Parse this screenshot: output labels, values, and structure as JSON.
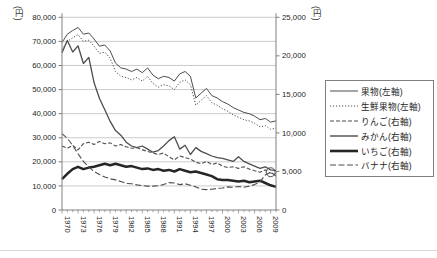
{
  "chart_data": {
    "type": "line",
    "title": "",
    "left_axis": {
      "unit_label": "(円)",
      "min": 0,
      "max": 80000,
      "tick_step": 10000,
      "tick_labels": [
        "0",
        "10,000",
        "20,000",
        "30,000",
        "40,000",
        "50,000",
        "60,000",
        "70,000",
        "80,000"
      ]
    },
    "right_axis": {
      "unit_label": "(円)",
      "min": 0,
      "max": 25000,
      "tick_step": 5000,
      "tick_labels": [
        "0",
        "5,000",
        "10,000",
        "15,000",
        "20,000",
        "25,000"
      ]
    },
    "x_axis": {
      "start_year": 1970,
      "end_year": 2010,
      "label_step": 3,
      "tick_labels": [
        "1970",
        "1973",
        "1976",
        "1979",
        "1982",
        "1985",
        "1988",
        "1991",
        "1994",
        "1997",
        "2000",
        "2003",
        "2006",
        "2009"
      ]
    },
    "grid": "horizontal",
    "legend_position": "right",
    "years": [
      1970,
      1971,
      1972,
      1973,
      1974,
      1975,
      1976,
      1977,
      1978,
      1979,
      1980,
      1981,
      1982,
      1983,
      1984,
      1985,
      1986,
      1987,
      1988,
      1989,
      1990,
      1991,
      1992,
      1993,
      1994,
      1995,
      1996,
      1997,
      1998,
      1999,
      2000,
      2001,
      2002,
      2003,
      2004,
      2005,
      2006,
      2007,
      2008,
      2009,
      2010
    ],
    "series": [
      {
        "name": "果物(左軸)",
        "axis": "left",
        "line_style": "solid-thin",
        "values": [
          69500,
          73000,
          74500,
          75800,
          73000,
          73500,
          71000,
          68000,
          68500,
          66000,
          61000,
          59000,
          58500,
          57500,
          58500,
          57000,
          59000,
          56000,
          54500,
          55500,
          55000,
          53500,
          56500,
          57500,
          55500,
          46500,
          48500,
          50500,
          47500,
          46500,
          45000,
          44000,
          42500,
          41500,
          40500,
          40000,
          39000,
          37500,
          38000,
          36500,
          37000
        ]
      },
      {
        "name": "生鮮果物(左軸)",
        "axis": "left",
        "line_style": "dotted",
        "values": [
          66500,
          70000,
          71500,
          72800,
          70000,
          70500,
          68000,
          65000,
          65500,
          63000,
          57500,
          55500,
          55000,
          54000,
          55000,
          53500,
          55500,
          52500,
          51000,
          52000,
          51500,
          50000,
          53000,
          54000,
          52000,
          43500,
          45500,
          47500,
          44500,
          43500,
          42000,
          41000,
          39500,
          38500,
          37500,
          37000,
          36000,
          34500,
          35000,
          33500,
          34000
        ]
      },
      {
        "name": "りんご(右軸)",
        "axis": "right",
        "line_style": "dashed",
        "values": [
          8300,
          8000,
          8400,
          7800,
          8600,
          8800,
          8500,
          8900,
          8600,
          8700,
          8300,
          8500,
          8200,
          8000,
          8100,
          7800,
          7600,
          7400,
          7200,
          7400,
          6900,
          6500,
          7000,
          6800,
          6600,
          6200,
          6000,
          6300,
          5900,
          6100,
          5700,
          5500,
          5600,
          5400,
          5600,
          5300,
          5100,
          4900,
          5200,
          4800,
          4700
        ]
      },
      {
        "name": "みかん(右軸)",
        "axis": "right",
        "line_style": "solid-medium",
        "values": [
          20400,
          22000,
          20500,
          21300,
          19000,
          19800,
          16500,
          14500,
          13000,
          11500,
          10300,
          9700,
          8800,
          8300,
          8100,
          8300,
          7900,
          7500,
          7700,
          8300,
          9000,
          9500,
          7900,
          8400,
          7200,
          8100,
          7600,
          7300,
          7000,
          6800,
          6700,
          6500,
          6300,
          6900,
          6300,
          6000,
          5700,
          5400,
          5600,
          5200,
          5100
        ]
      },
      {
        "name": "いちご(右軸)",
        "axis": "right",
        "line_style": "solid-thick",
        "values": [
          4000,
          4700,
          5300,
          5600,
          5300,
          5500,
          5600,
          5800,
          6000,
          5800,
          6000,
          5800,
          5600,
          5700,
          5500,
          5300,
          5400,
          5200,
          5300,
          5100,
          5200,
          5000,
          5300,
          5100,
          4900,
          5000,
          4800,
          4600,
          4400,
          4000,
          3900,
          3900,
          3800,
          3700,
          3800,
          3600,
          3700,
          3800,
          3500,
          3200,
          3000
        ]
      },
      {
        "name": "バナナ(右軸)",
        "axis": "right",
        "line_style": "long-dashed",
        "values": [
          9900,
          9300,
          8400,
          7300,
          6300,
          5600,
          5000,
          4600,
          4300,
          4050,
          3900,
          3700,
          3450,
          3400,
          3250,
          3150,
          3100,
          3100,
          3150,
          3300,
          3550,
          3500,
          3300,
          3400,
          3200,
          3000,
          2700,
          2650,
          2700,
          2800,
          2850,
          3000,
          2950,
          3050,
          2950,
          3100,
          3300,
          3650,
          4550,
          4900,
          4400
        ]
      }
    ],
    "annotation": {
      "shape": "circle",
      "series": "バナナ(右軸)",
      "year": 2009,
      "value": 4900
    },
    "colors": {
      "line": "#4d4d4d",
      "thick_line": "#262626",
      "gridline": "#bfbfbf",
      "spine": "#808080",
      "tick_text": "#262626"
    }
  }
}
